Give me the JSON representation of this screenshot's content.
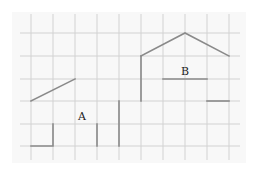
{
  "diagram": {
    "labels": {
      "a": "A",
      "b": "B"
    },
    "grid": {
      "columns": 10,
      "rows": 6
    },
    "colors": {
      "background": "#ffffff",
      "panel": "#f8f8f8",
      "gridline": "#d2d2d2",
      "shape_line": "#8a8a8a",
      "label_text": "#222222"
    }
  }
}
